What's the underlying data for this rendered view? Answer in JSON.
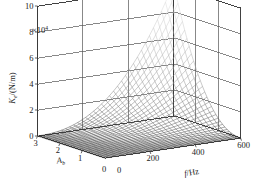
{
  "figure": {
    "type": "3d-surface-mesh-plot",
    "exponent_label": "×10",
    "exponent_value": "4",
    "zlabel_main": "K",
    "zlabel_sub": "e",
    "zlabel_units": "/(N/m)",
    "xlabel_main": "f",
    "xlabel_units": "/Hz",
    "ylabel_main": "A",
    "ylabel_sub": "b",
    "origin_label_left": "0",
    "origin_label_right": "0"
  },
  "chart_data": {
    "type": "line",
    "render": "3d-wireframe-surface",
    "title": "",
    "xlabel": "f/Hz",
    "ylabel": "A_b",
    "zlabel": "K_e/(N/m)",
    "z_scale_multiplier": 10000,
    "z_scale_text": "×10^4",
    "xlim": [
      0,
      600
    ],
    "ylim": [
      0,
      3
    ],
    "zlim": [
      0,
      10
    ],
    "xticks": [
      0,
      200,
      400,
      600
    ],
    "yticks": [
      0,
      1,
      2,
      3
    ],
    "zticks": [
      0,
      2,
      4,
      6,
      8,
      10
    ],
    "xtick_labels": [
      "0",
      "200",
      "400",
      "600"
    ],
    "ytick_labels": [
      "0",
      "1",
      "2",
      "3"
    ],
    "ztick_labels": [
      "0",
      "2",
      "4",
      "6",
      "8",
      "10"
    ],
    "grid": true,
    "legend": null,
    "colormap": "grayscale",
    "mesh_nx": 34,
    "mesh_ny": 30,
    "peak": {
      "f": 600,
      "A_b": 3,
      "K_e": 10.2
    },
    "surface_samples": [
      {
        "A_b": 0.0,
        "values_by_f": [
          0.0,
          0.02,
          0.04,
          0.06,
          0.09,
          0.12,
          0.15
        ]
      },
      {
        "A_b": 0.5,
        "values_by_f": [
          0.0,
          0.04,
          0.1,
          0.18,
          0.28,
          0.4,
          0.55
        ]
      },
      {
        "A_b": 1.0,
        "values_by_f": [
          0.0,
          0.08,
          0.22,
          0.42,
          0.7,
          1.05,
          1.5
        ]
      },
      {
        "A_b": 1.5,
        "values_by_f": [
          0.0,
          0.14,
          0.4,
          0.8,
          1.4,
          2.2,
          3.2
        ]
      },
      {
        "A_b": 2.0,
        "values_by_f": [
          0.0,
          0.22,
          0.7,
          1.5,
          2.7,
          4.2,
          5.6
        ]
      },
      {
        "A_b": 2.5,
        "values_by_f": [
          0.0,
          0.34,
          1.1,
          2.5,
          4.5,
          6.8,
          8.4
        ]
      },
      {
        "A_b": 3.0,
        "values_by_f": [
          0.0,
          0.5,
          1.7,
          3.8,
          6.5,
          9.0,
          10.2
        ]
      }
    ],
    "f_samples": [
      0,
      100,
      200,
      300,
      400,
      500,
      600
    ]
  },
  "style": {
    "axis_color": "#3a3a3a",
    "grid_color": "#555555",
    "mesh_color_low": "#2b2b2b",
    "mesh_color_high": "#e8e8e8",
    "background": "#ffffff"
  }
}
